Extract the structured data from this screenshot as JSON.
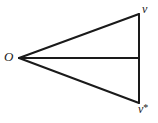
{
  "figure": {
    "kind": "geometry-diagram",
    "background_color": "#ffffff",
    "stroke_color": "#1a1a1a",
    "stroke_width": 2,
    "width": 158,
    "height": 123,
    "labels": {
      "apex": "O",
      "top_vertex": "v",
      "bottom_vertex": "v",
      "bottom_vertex_superscript": "*",
      "bottom_vertex_full": "v*"
    },
    "points": {
      "O": {
        "x": 19,
        "y": 58
      },
      "v": {
        "x": 139,
        "y": 14
      },
      "v_star": {
        "x": 139,
        "y": 103
      },
      "midpoint": {
        "x": 139,
        "y": 58
      }
    },
    "segments": [
      {
        "name": "upper-ray",
        "from": "O",
        "to": "v"
      },
      {
        "name": "lower-ray",
        "from": "O",
        "to": "v_star"
      },
      {
        "name": "right-edge",
        "from": "v",
        "to": "v_star"
      },
      {
        "name": "median",
        "from": "O",
        "to": "midpoint"
      }
    ]
  }
}
